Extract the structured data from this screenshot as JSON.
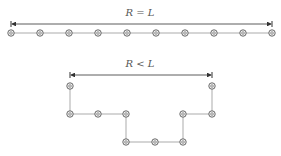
{
  "diagram": {
    "colors": {
      "line": "#888888",
      "arrow": "#333333",
      "bead_fill": "#bbbbbb",
      "bead_stroke": "#555555",
      "text": "#555555"
    },
    "top": {
      "label": "R = L",
      "label_pos": [
        140,
        16
      ],
      "arrow": {
        "x1": 11,
        "x2": 272,
        "y": 24
      },
      "beads": [
        [
          11,
          33
        ],
        [
          40,
          33
        ],
        [
          69,
          33
        ],
        [
          98,
          33
        ],
        [
          127,
          33
        ],
        [
          156,
          33
        ],
        [
          185,
          33
        ],
        [
          214,
          33
        ],
        [
          243,
          33
        ],
        [
          272,
          33
        ]
      ]
    },
    "bottom": {
      "label": "R < L",
      "label_pos": [
        140,
        67
      ],
      "arrow": {
        "x1": 70,
        "x2": 212,
        "y": 75
      },
      "beads": [
        [
          70,
          86
        ],
        [
          70,
          114
        ],
        [
          98,
          114
        ],
        [
          126,
          114
        ],
        [
          126,
          142
        ],
        [
          155,
          142
        ],
        [
          183,
          142
        ],
        [
          183,
          114
        ],
        [
          212,
          114
        ],
        [
          212,
          86
        ]
      ]
    }
  }
}
